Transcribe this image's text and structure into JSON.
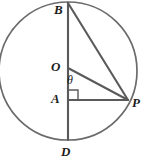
{
  "diagram": {
    "type": "circle-geometry",
    "colors": {
      "stroke": "#555555",
      "circle_stroke": "#6b6b6b",
      "label_text": "#1c1c1c",
      "background": "#ffffff"
    },
    "circle": {
      "name": "main-circle",
      "center_x": 68,
      "center_y": 71,
      "radius": 69
    },
    "points": [
      {
        "id": "B",
        "label": "B",
        "x": 68,
        "y": 3,
        "label_x": 54,
        "label_y": 3,
        "description": "top of circle"
      },
      {
        "id": "O",
        "label": "O",
        "x": 68,
        "y": 68,
        "label_x": 51,
        "label_y": 60,
        "description": "center of circle"
      },
      {
        "id": "A",
        "label": "A",
        "x": 68,
        "y": 100,
        "label_x": 51,
        "label_y": 92,
        "description": "foot of perpendicular on BD"
      },
      {
        "id": "D",
        "label": "D",
        "x": 68,
        "y": 140,
        "label_x": 61,
        "label_y": 145,
        "description": "bottom of circle"
      },
      {
        "id": "P",
        "label": "P",
        "x": 128,
        "y": 100,
        "label_x": 132,
        "label_y": 96,
        "description": "point on circle at right"
      }
    ],
    "segments": [
      {
        "name": "segment-BD",
        "from": "B",
        "to": "D",
        "x1": 68,
        "y1": 3,
        "x2": 68,
        "y2": 140
      },
      {
        "name": "segment-BP",
        "from": "B",
        "to": "P",
        "x1": 68,
        "y1": 3,
        "x2": 128,
        "y2": 100
      },
      {
        "name": "segment-OP",
        "from": "O",
        "to": "P",
        "x1": 68,
        "y1": 68,
        "x2": 128,
        "y2": 100
      },
      {
        "name": "segment-AP",
        "from": "A",
        "to": "P",
        "x1": 68,
        "y1": 100,
        "x2": 128,
        "y2": 100
      }
    ],
    "angles": [
      {
        "name": "angle-theta-at-O",
        "label": "θ",
        "vertex": "O",
        "between": [
          "OA",
          "OP"
        ],
        "label_x": 67,
        "label_y": 74
      },
      {
        "name": "right-angle-at-A",
        "label": "",
        "vertex": "A",
        "between": [
          "AB",
          "AP"
        ],
        "marker": "square",
        "size": 10
      }
    ]
  }
}
